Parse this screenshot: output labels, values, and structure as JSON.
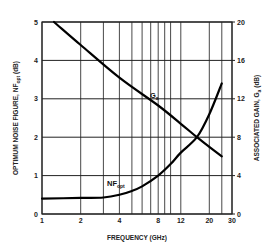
{
  "chart_data": {
    "type": "line",
    "title": "",
    "xlabel": "FREQUENCY (GHz)",
    "ylabel": "OPTIMUM NOISE FIGURE, NFopt (dB)",
    "y2label": "ASSOCIATED GAIN, Ga (dB)",
    "xscale": "log",
    "xlim": [
      1,
      30
    ],
    "ylim": [
      0,
      5
    ],
    "y2lim": [
      0,
      20
    ],
    "grid": true,
    "x_ticks": [
      "1",
      "2",
      "4",
      "8",
      "12",
      "20",
      "30"
    ],
    "x_gridlines": [
      1,
      2,
      3,
      4,
      5,
      6,
      7,
      8,
      9,
      10,
      12,
      20,
      25,
      30
    ],
    "y_ticks": [
      "0",
      "1",
      "2",
      "3",
      "4",
      "5"
    ],
    "y2_ticks": [
      "0",
      "4",
      "8",
      "12",
      "16",
      "20"
    ],
    "series": [
      {
        "name": "Ga",
        "label": "Ga",
        "axis": "right",
        "x": [
          1.24,
          2,
          4,
          8,
          12,
          16,
          20,
          25
        ],
        "values": [
          20,
          17.6,
          14.2,
          11.3,
          9.4,
          8.0,
          7.0,
          6.0
        ]
      },
      {
        "name": "NFopt",
        "label": "NFopt",
        "axis": "left",
        "x": [
          1,
          2,
          3,
          4,
          5,
          6,
          8,
          10,
          12,
          16,
          20,
          25
        ],
        "values": [
          0.4,
          0.42,
          0.43,
          0.5,
          0.6,
          0.72,
          1.0,
          1.3,
          1.6,
          2.0,
          2.6,
          3.4
        ]
      }
    ]
  },
  "labels": {
    "ga": "G",
    "ga_sub": "a",
    "nf": "NF",
    "nf_sub": "opt",
    "xlabel": "FREQUENCY (GHz)",
    "ylabel_main": "OPTIMUM NOISE FIGURE, NF",
    "ylabel_sub": "opt",
    "ylabel_unit": " (dB)",
    "y2label_main": "ASSOCIATED GAIN, G",
    "y2label_sub": "a",
    "y2label_unit": " (dB)"
  }
}
